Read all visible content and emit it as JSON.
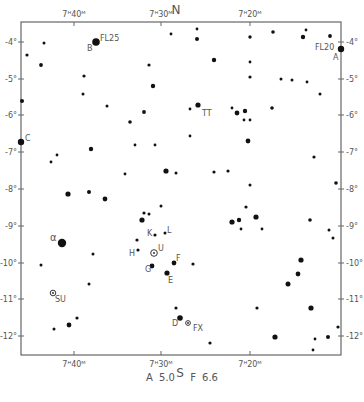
{
  "chart_data": {
    "type": "scatter",
    "compass": {
      "north": "N",
      "south": "S"
    },
    "x_axis": {
      "label": "Right Ascension",
      "ticks": [
        {
          "label": "7ᴴ40ᴹ",
          "x": 74
        },
        {
          "label": "7ᴴ30ᴹ",
          "x": 161
        },
        {
          "label": "7ᴴ20ᴹ",
          "x": 250
        }
      ]
    },
    "y_axis": {
      "label": "Declination",
      "ticks": [
        {
          "label": "-4°",
          "y": 42
        },
        {
          "label": "-5°",
          "y": 79
        },
        {
          "label": "-6°",
          "y": 115
        },
        {
          "label": "-7°",
          "y": 152
        },
        {
          "label": "-8°",
          "y": 189
        },
        {
          "label": "-9°",
          "y": 226
        },
        {
          "label": "-10°",
          "y": 263
        },
        {
          "label": "-11°",
          "y": 299
        },
        {
          "label": "-12°",
          "y": 336
        }
      ]
    },
    "frame": {
      "left": 21,
      "top": 22,
      "right": 341,
      "bottom": 355
    },
    "stars": [
      {
        "x": 96,
        "y": 42,
        "r": 3.8,
        "label": "FL25"
      },
      {
        "x": 44,
        "y": 43,
        "r": 1.5
      },
      {
        "x": 27,
        "y": 55,
        "r": 1.6
      },
      {
        "x": 41,
        "y": 65,
        "r": 1.9
      },
      {
        "x": 84,
        "y": 76,
        "r": 1.6
      },
      {
        "x": 83,
        "y": 94,
        "r": 1.5
      },
      {
        "x": 107,
        "y": 106,
        "r": 1.5
      },
      {
        "x": 22,
        "y": 101,
        "r": 2.0
      },
      {
        "x": 130,
        "y": 122,
        "r": 1.8
      },
      {
        "x": 144,
        "y": 112,
        "r": 1.9
      },
      {
        "x": 149,
        "y": 65,
        "r": 1.6
      },
      {
        "x": 153,
        "y": 86,
        "r": 2.2
      },
      {
        "x": 171,
        "y": 34,
        "r": 1.4
      },
      {
        "x": 197,
        "y": 39,
        "r": 2.0
      },
      {
        "x": 197,
        "y": 29,
        "r": 1.4
      },
      {
        "x": 214,
        "y": 60,
        "r": 2.2
      },
      {
        "x": 250,
        "y": 37,
        "r": 1.7
      },
      {
        "x": 250,
        "y": 62,
        "r": 1.4
      },
      {
        "x": 250,
        "y": 77,
        "r": 1.6
      },
      {
        "x": 273,
        "y": 32,
        "r": 1.8
      },
      {
        "x": 303,
        "y": 37,
        "r": 2.2
      },
      {
        "x": 306,
        "y": 30,
        "r": 1.4
      },
      {
        "x": 330,
        "y": 36,
        "r": 1.9
      },
      {
        "x": 341,
        "y": 49,
        "r": 3.2,
        "label": "FL20"
      },
      {
        "x": 281,
        "y": 79,
        "r": 1.5
      },
      {
        "x": 292,
        "y": 80,
        "r": 1.5
      },
      {
        "x": 307,
        "y": 82,
        "r": 1.4
      },
      {
        "x": 320,
        "y": 94,
        "r": 1.5
      },
      {
        "x": 232,
        "y": 108,
        "r": 1.4
      },
      {
        "x": 190,
        "y": 109,
        "r": 1.4
      },
      {
        "x": 198,
        "y": 105,
        "r": 2.6
      },
      {
        "x": 237,
        "y": 113,
        "r": 2.4
      },
      {
        "x": 245,
        "y": 111,
        "r": 2.2
      },
      {
        "x": 272,
        "y": 108,
        "r": 1.8
      },
      {
        "x": 244,
        "y": 120,
        "r": 1.4
      },
      {
        "x": 250,
        "y": 120,
        "r": 1.4
      },
      {
        "x": 21,
        "y": 142,
        "r": 3.2,
        "label": "C"
      },
      {
        "x": 91,
        "y": 149,
        "r": 2.2
      },
      {
        "x": 135,
        "y": 145,
        "r": 1.4
      },
      {
        "x": 155,
        "y": 145,
        "r": 1.4
      },
      {
        "x": 57,
        "y": 155,
        "r": 1.4
      },
      {
        "x": 51,
        "y": 162,
        "r": 1.4
      },
      {
        "x": 125,
        "y": 174,
        "r": 1.4
      },
      {
        "x": 166,
        "y": 171,
        "r": 2.6
      },
      {
        "x": 176,
        "y": 173,
        "r": 1.5
      },
      {
        "x": 248,
        "y": 141,
        "r": 2.4
      },
      {
        "x": 190,
        "y": 136,
        "r": 1.4
      },
      {
        "x": 214,
        "y": 172,
        "r": 1.6
      },
      {
        "x": 228,
        "y": 171,
        "r": 1.6
      },
      {
        "x": 250,
        "y": 185,
        "r": 1.5
      },
      {
        "x": 314,
        "y": 157,
        "r": 1.6
      },
      {
        "x": 336,
        "y": 183,
        "r": 1.8
      },
      {
        "x": 68,
        "y": 194,
        "r": 2.6
      },
      {
        "x": 89,
        "y": 192,
        "r": 2.0
      },
      {
        "x": 105,
        "y": 199,
        "r": 2.4
      },
      {
        "x": 161,
        "y": 206,
        "r": 1.5
      },
      {
        "x": 246,
        "y": 207,
        "r": 1.6
      },
      {
        "x": 144,
        "y": 213,
        "r": 1.6
      },
      {
        "x": 149,
        "y": 214,
        "r": 1.5
      },
      {
        "x": 142,
        "y": 220,
        "r": 2.6
      },
      {
        "x": 239,
        "y": 220,
        "r": 2.2
      },
      {
        "x": 256,
        "y": 217,
        "r": 2.6
      },
      {
        "x": 232,
        "y": 222,
        "r": 2.6
      },
      {
        "x": 310,
        "y": 220,
        "r": 1.8
      },
      {
        "x": 241,
        "y": 229,
        "r": 1.4
      },
      {
        "x": 262,
        "y": 229,
        "r": 1.4
      },
      {
        "x": 329,
        "y": 230,
        "r": 1.5
      },
      {
        "x": 333,
        "y": 238,
        "r": 1.5
      },
      {
        "x": 155,
        "y": 235,
        "r": 1.6,
        "label": "K"
      },
      {
        "x": 165,
        "y": 233,
        "r": 1.5,
        "label": "L"
      },
      {
        "x": 137,
        "y": 240,
        "r": 1.6
      },
      {
        "x": 138,
        "y": 250,
        "r": 1.6,
        "label": "H"
      },
      {
        "x": 62,
        "y": 243,
        "r": 4.2,
        "label": "α"
      },
      {
        "x": 154,
        "y": 253,
        "r": 2.5,
        "type": "variable",
        "label": "U"
      },
      {
        "x": 174,
        "y": 263,
        "r": 2.4,
        "label": "F"
      },
      {
        "x": 193,
        "y": 264,
        "r": 1.6
      },
      {
        "x": 152,
        "y": 266,
        "r": 2.4,
        "label": "G"
      },
      {
        "x": 167,
        "y": 273,
        "r": 2.6,
        "label": "E"
      },
      {
        "x": 93,
        "y": 254,
        "r": 1.5
      },
      {
        "x": 41,
        "y": 265,
        "r": 1.5
      },
      {
        "x": 89,
        "y": 284,
        "r": 1.5
      },
      {
        "x": 301,
        "y": 260,
        "r": 2.6
      },
      {
        "x": 298,
        "y": 274,
        "r": 2.4
      },
      {
        "x": 288,
        "y": 284,
        "r": 2.5
      },
      {
        "x": 53,
        "y": 293,
        "r": 2.0,
        "type": "variable",
        "label": "SU"
      },
      {
        "x": 176,
        "y": 308,
        "r": 1.6
      },
      {
        "x": 180,
        "y": 318,
        "r": 2.8,
        "label": "D"
      },
      {
        "x": 188,
        "y": 323,
        "r": 1.6,
        "type": "variable",
        "label": "FX"
      },
      {
        "x": 257,
        "y": 308,
        "r": 1.6
      },
      {
        "x": 311,
        "y": 308,
        "r": 2.6
      },
      {
        "x": 77,
        "y": 318,
        "r": 1.6
      },
      {
        "x": 69,
        "y": 325,
        "r": 2.4
      },
      {
        "x": 54,
        "y": 329,
        "r": 1.5
      },
      {
        "x": 210,
        "y": 343,
        "r": 1.6
      },
      {
        "x": 275,
        "y": 337,
        "r": 2.6
      },
      {
        "x": 315,
        "y": 339,
        "r": 1.4
      },
      {
        "x": 328,
        "y": 337,
        "r": 2.0
      },
      {
        "x": 338,
        "y": 327,
        "r": 1.6
      },
      {
        "x": 313,
        "y": 350,
        "r": 1.4
      }
    ],
    "labels": [
      {
        "text": "FL25",
        "x": 100,
        "y": 41
      },
      {
        "text": "B",
        "x": 87,
        "y": 51
      },
      {
        "text": "FL20",
        "x": 315,
        "y": 50
      },
      {
        "text": "A",
        "x": 333,
        "y": 60
      },
      {
        "text": "TT",
        "x": 202,
        "y": 116
      },
      {
        "text": "C",
        "x": 25,
        "y": 141
      },
      {
        "text": "α",
        "x": 50,
        "y": 241
      },
      {
        "text": "K",
        "x": 147,
        "y": 236
      },
      {
        "text": "L",
        "x": 167,
        "y": 233
      },
      {
        "text": "H",
        "x": 129,
        "y": 256
      },
      {
        "text": "U",
        "x": 158,
        "y": 251
      },
      {
        "text": "F",
        "x": 176,
        "y": 261
      },
      {
        "text": "G",
        "x": 145,
        "y": 272
      },
      {
        "text": "E",
        "x": 168,
        "y": 283
      },
      {
        "text": "SU",
        "x": 55,
        "y": 302
      },
      {
        "text": "D",
        "x": 172,
        "y": 326
      },
      {
        "text": "FX",
        "x": 193,
        "y": 331
      }
    ],
    "legend": [
      {
        "label": "A",
        "value": "5.0"
      },
      {
        "label": "F",
        "value": "6.6"
      }
    ]
  }
}
